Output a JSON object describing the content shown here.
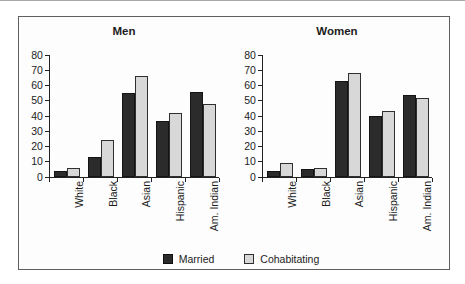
{
  "colors": {
    "married": "#2b2b2b",
    "cohabitating": "#d8d8d8",
    "axis": "#222222",
    "text": "#1c1c1c",
    "frame_border": "#5f5f5f",
    "frame_background": "#fdfdfd"
  },
  "figure": {
    "legend": {
      "items": [
        {
          "label": "Married",
          "swatch": "married"
        },
        {
          "label": "Cohabitating",
          "swatch": "cohabitating"
        }
      ]
    }
  },
  "chart_data": [
    {
      "type": "bar",
      "title": "Men",
      "categories": [
        "White",
        "Black",
        "Asian",
        "Hispanic",
        "Am. Indian"
      ],
      "series": [
        {
          "name": "Married",
          "values": [
            4,
            13,
            55,
            37,
            56
          ]
        },
        {
          "name": "Cohabitating",
          "values": [
            6,
            24,
            66,
            42,
            48
          ]
        }
      ],
      "ylim": [
        0,
        80
      ],
      "ytick_step": 10,
      "yticks": [
        0,
        10,
        20,
        30,
        40,
        50,
        60,
        70,
        80
      ],
      "grid": false,
      "legend_position": "bottom-shared"
    },
    {
      "type": "bar",
      "title": "Women",
      "categories": [
        "White",
        "Black",
        "Asian",
        "Hispanic",
        "Am. Indian"
      ],
      "series": [
        {
          "name": "Married",
          "values": [
            4,
            5,
            63,
            40,
            54
          ]
        },
        {
          "name": "Cohabitating",
          "values": [
            9,
            6,
            68,
            43,
            52
          ]
        }
      ],
      "ylim": [
        0,
        80
      ],
      "ytick_step": 10,
      "yticks": [
        0,
        10,
        20,
        30,
        40,
        50,
        60,
        70,
        80
      ],
      "grid": false,
      "legend_position": "bottom-shared"
    }
  ]
}
